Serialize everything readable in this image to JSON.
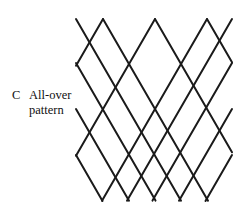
{
  "figure": {
    "label_letter": "C",
    "caption_line_1": "All-over",
    "caption_line_2": "pattern",
    "caption_full": "All-over pattern",
    "background_color": "#ffffff",
    "line_color": "#1a1a1a",
    "line_width": 2,
    "canvas": {
      "width": 250,
      "height": 218
    }
  },
  "chart_data": {
    "type": "diagram",
    "title": "All-over pattern",
    "columns": 3,
    "rows": 2,
    "diamond_width": 52,
    "diamond_height": 90,
    "apex_x_positions": [
      103,
      155,
      207
    ],
    "side_x_positions": [
      76,
      128,
      180,
      232
    ],
    "row_y_positions": [
      19,
      63,
      109,
      155,
      201
    ],
    "stroke": "#1a1a1a",
    "stroke_width": 2,
    "fill": "none",
    "grid": false,
    "legend": false
  }
}
